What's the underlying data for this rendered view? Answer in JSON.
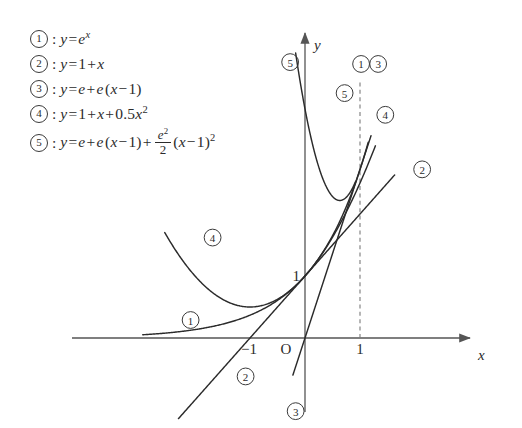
{
  "legend": {
    "items": [
      {
        "marker": "1",
        "equation": "y = e^x"
      },
      {
        "marker": "2",
        "equation": "y = 1 + x"
      },
      {
        "marker": "3",
        "equation": "y = e + e(x-1)"
      },
      {
        "marker": "4",
        "equation": "y = 1 + x + 0.5x^2"
      },
      {
        "marker": "5",
        "equation": "y = e + e(x-1) + (e^2/2)(x-1)^2"
      }
    ],
    "parts": {
      "y": "y",
      "eq": "=",
      "plus": "+",
      "minus": "−",
      "e": "e",
      "x": "x",
      "one": "1",
      "two": "2",
      "half": "0.5",
      "lparen": "(",
      "rparen": ")",
      "colon": ":"
    }
  },
  "chart_data": {
    "type": "line",
    "title": "",
    "xlabel": "x",
    "ylabel": "y",
    "xlim": [
      -2.95,
      2.2
    ],
    "ylim": [
      -1.65,
      4.9
    ],
    "grid": false,
    "legend_position": "top-left",
    "axis_ticks": {
      "x": [
        {
          "value": -1,
          "label": "−1"
        },
        {
          "value": 0,
          "label": "O"
        },
        {
          "value": 1,
          "label": "1"
        }
      ],
      "y": [
        {
          "value": 1,
          "label": "1"
        }
      ]
    },
    "annotations": [
      {
        "label": "1",
        "kind": "curve-tag",
        "x": 1.02,
        "y": 4.42
      },
      {
        "label": "3",
        "kind": "curve-tag",
        "x": 1.33,
        "y": 4.42
      },
      {
        "label": "5",
        "kind": "curve-tag",
        "x": 0.72,
        "y": 3.95
      },
      {
        "label": "5",
        "kind": "curve-tag",
        "x": -0.27,
        "y": 4.45
      },
      {
        "label": "4",
        "kind": "curve-tag",
        "x": 1.46,
        "y": 3.6
      },
      {
        "label": "2",
        "kind": "curve-tag",
        "x": 2.13,
        "y": 2.72
      },
      {
        "label": "4",
        "kind": "curve-tag",
        "x": -1.68,
        "y": 1.62
      },
      {
        "label": "1",
        "kind": "curve-tag",
        "x": -2.08,
        "y": 0.29
      },
      {
        "label": "2",
        "kind": "curve-tag",
        "x": -1.08,
        "y": -0.62
      },
      {
        "label": "3",
        "kind": "curve-tag",
        "x": -0.17,
        "y": -1.18
      }
    ],
    "reference_lines": [
      {
        "kind": "vertical-dashed",
        "x": 1.0,
        "y_from": 0.0,
        "y_to": 4.16
      }
    ],
    "series": [
      {
        "name": "1",
        "expr": "e^x",
        "x_range": [
          -2.95,
          1.15
        ],
        "style": "solid"
      },
      {
        "name": "2",
        "expr": "1+x",
        "x_range": [
          -2.3,
          1.63
        ],
        "style": "solid"
      },
      {
        "name": "3",
        "expr": "e+e*(x-1)",
        "x_range": [
          -0.22,
          1.2
        ],
        "style": "solid"
      },
      {
        "name": "4",
        "expr": "1+x+0.5*x^2",
        "x_range": [
          -2.55,
          1.28
        ],
        "style": "solid"
      },
      {
        "name": "5",
        "expr": "e+e*(x-1)+(e^2/2)*(x-1)^2",
        "x_range": [
          -0.17,
          0.92
        ],
        "style": "solid"
      }
    ],
    "constants": {
      "e": 2.718281828,
      "e_squared_over_2": 3.694528
    }
  },
  "geometry": {
    "origin_px": {
      "x": 305,
      "y": 338
    },
    "unit_px": {
      "x": 55,
      "y": 62
    },
    "x_axis_px": {
      "x1": 72,
      "x2": 470,
      "y": 338
    },
    "y_axis_px": {
      "x": 305,
      "y1": 33,
      "y2": 412
    }
  }
}
